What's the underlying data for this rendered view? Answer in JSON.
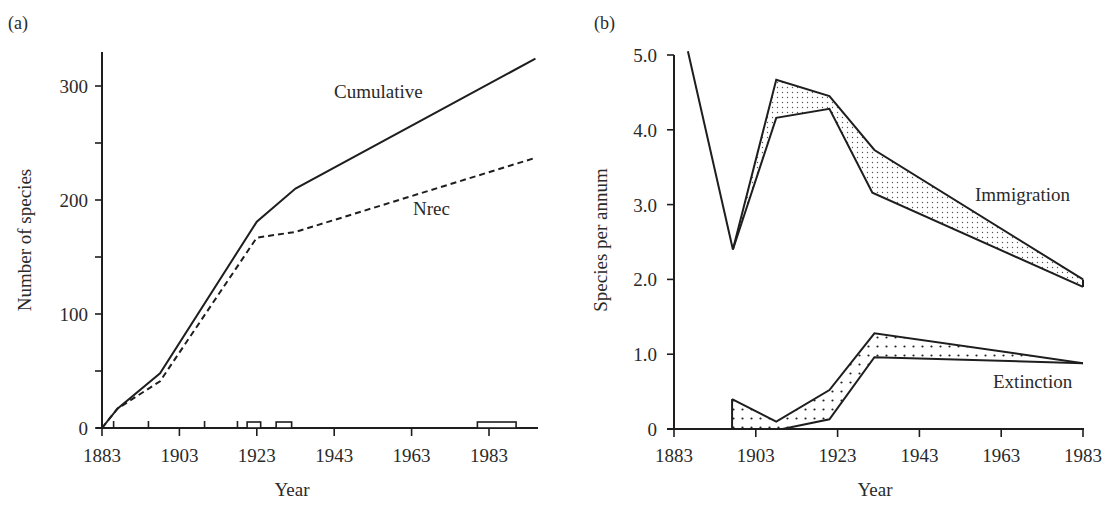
{
  "chart_data": [
    {
      "type": "line",
      "panel_label": "(a)",
      "title": "",
      "xlabel": "Year",
      "ylabel": "Number of species",
      "xlim": [
        1883,
        1995
      ],
      "ylim": [
        0,
        330
      ],
      "x_ticks": [
        1883,
        1903,
        1923,
        1943,
        1963,
        1983
      ],
      "x_tick_labels": [
        "1883",
        "1903",
        "1923",
        "1943",
        "1963",
        "1983"
      ],
      "x_minor_ticks": [
        1892,
        1917
      ],
      "y_ticks": [
        0,
        100,
        200,
        300
      ],
      "y_tick_labels": [
        "0",
        "100",
        "200",
        "300"
      ],
      "y_minor_ticks": [
        50,
        150,
        250
      ],
      "grid": false,
      "legend": "inline labels",
      "series": [
        {
          "name": "Cumulative",
          "style": "solid",
          "x": [
            1883,
            1887,
            1898,
            1923,
            1933,
            1995
          ],
          "values": [
            0,
            17,
            48,
            181,
            210,
            324
          ]
        },
        {
          "name": "Nrec",
          "style": "dashed",
          "x": [
            1883,
            1887,
            1898,
            1923,
            1933,
            1995
          ],
          "values": [
            0,
            17,
            41,
            167,
            172,
            237
          ]
        }
      ],
      "annotations": [
        {
          "type": "survey-period-box",
          "x_start": 1920.5,
          "x_end": 1924
        },
        {
          "type": "survey-period-box",
          "x_start": 1928,
          "x_end": 1932
        },
        {
          "type": "survey-period-box",
          "x_start": 1980,
          "x_end": 1990
        }
      ],
      "series_labels": [
        {
          "text": "Cumulative",
          "x": 1937,
          "y": 292
        },
        {
          "text": "Nrec",
          "x": 1957,
          "y": 186
        }
      ]
    },
    {
      "type": "area",
      "panel_label": "(b)",
      "title": "",
      "xlabel": "Year",
      "ylabel": "Species per annum",
      "xlim": [
        1883,
        1983
      ],
      "ylim": [
        0,
        5.0
      ],
      "x_ticks": [
        1883,
        1903,
        1923,
        1943,
        1963,
        1983
      ],
      "x_tick_labels": [
        "1883",
        "1903",
        "1923",
        "1943",
        "1963",
        "1983"
      ],
      "y_ticks": [
        0,
        1.0,
        2.0,
        3.0,
        4.0,
        5.0
      ],
      "y_tick_labels": [
        "0",
        "1.0",
        "2.0",
        "3.0",
        "4.0",
        "5.0"
      ],
      "grid": false,
      "legend": "inline labels",
      "series": [
        {
          "name": "Immigration (upper)",
          "x": [
            1886.4,
            1897.4,
            1908,
            1921,
            1932,
            1983
          ],
          "values": [
            5.05,
            2.4,
            4.67,
            4.45,
            3.73,
            2.0
          ]
        },
        {
          "name": "Immigration (lower)",
          "x": [
            1897.4,
            1908,
            1921,
            1931.5,
            1983
          ],
          "values": [
            2.4,
            4.16,
            4.28,
            3.16,
            1.9
          ]
        },
        {
          "name": "Extinction (upper)",
          "x": [
            1897.2,
            1908,
            1921,
            1932,
            1983
          ],
          "values": [
            0.4,
            0.1,
            0.52,
            1.28,
            0.88
          ]
        },
        {
          "name": "Extinction (lower)",
          "x": [
            1897.2,
            1909.5,
            1921,
            1932,
            1983
          ],
          "values": [
            0,
            0,
            0.13,
            0.96,
            0.88
          ]
        }
      ],
      "series_labels": [
        {
          "text": "Immigration",
          "x": 1974,
          "y": 3.1
        },
        {
          "text": "Extinction",
          "x": 1975,
          "y": 0.68
        }
      ]
    }
  ],
  "figure": {
    "panel_a_label": "(a)",
    "panel_b_label": "(b)",
    "left_xlabel": "Year",
    "left_ylabel": "Number of species",
    "right_xlabel": "Year",
    "right_ylabel": "Species per annum",
    "cumulative_label": "Cumulative",
    "nrec_label": "Nrec",
    "immigration_label": "Immigration",
    "extinction_label": "Extinction",
    "colors": {
      "line": "#1e1e1e",
      "text": "#2a2a2a",
      "background": "#ffffff"
    }
  }
}
